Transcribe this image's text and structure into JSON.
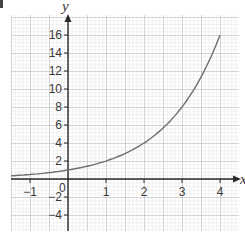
{
  "chart_data": {
    "type": "line",
    "title": "",
    "xlabel": "y",
    "ylabel": "y",
    "x_axis_label": "x",
    "y_axis_label": "y",
    "xlim": [
      -1.5,
      4.5
    ],
    "ylim": [
      -5.7,
      18.3
    ],
    "grid": true,
    "x_ticks": [
      -1,
      1,
      2,
      3,
      4
    ],
    "x_tick_labels": [
      "−1",
      "1",
      "2",
      "3",
      "4"
    ],
    "y_ticks": [
      16,
      14,
      12,
      10,
      8,
      6,
      4,
      2,
      -2,
      -4
    ],
    "y_tick_labels": [
      "16",
      "14",
      "12",
      "10",
      "8",
      "6",
      "4",
      "2",
      "−2",
      "−4"
    ],
    "origin_label": "0",
    "series": [
      {
        "name": "y = 2^x",
        "x": [
          -1.5,
          -1,
          -0.5,
          0,
          0.5,
          1,
          1.5,
          2,
          2.5,
          3,
          3.5,
          4
        ],
        "y": [
          0.35,
          0.5,
          0.71,
          1,
          1.41,
          2,
          2.83,
          4,
          5.66,
          8,
          11.31,
          16
        ]
      }
    ],
    "colors": {
      "curve": "#6e6e6e",
      "axis": "#2a2a2a",
      "grid_minor": "#d4d4d4",
      "grid_major": "#a8a8a8"
    }
  }
}
